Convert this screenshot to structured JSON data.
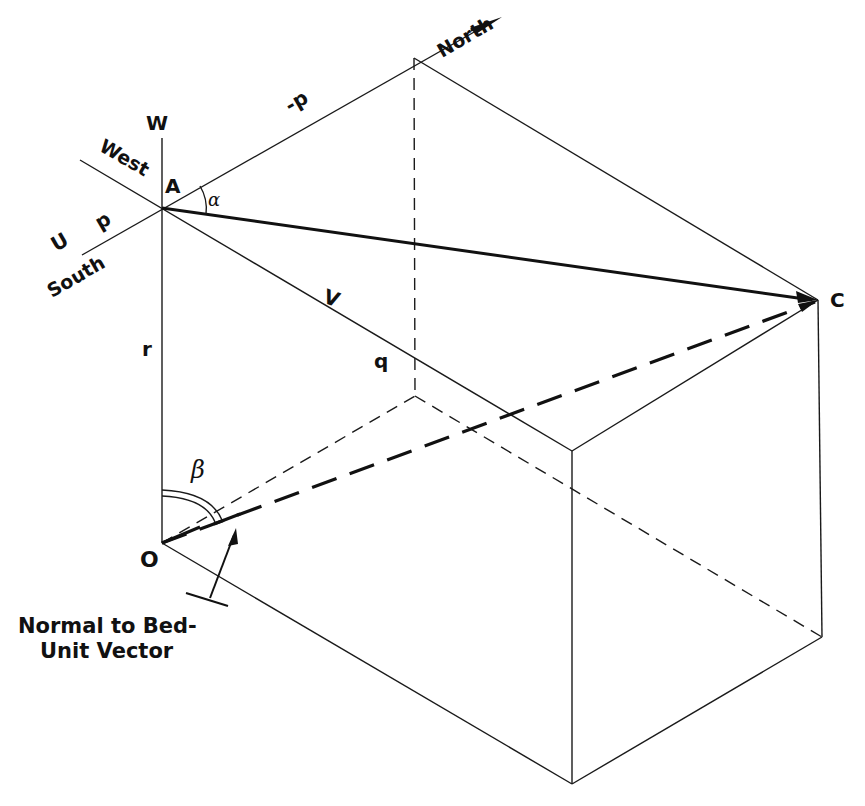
{
  "figure": {
    "points": {
      "A": "A",
      "C": "C",
      "O": "O"
    },
    "axes": {
      "W": "W",
      "U": "U",
      "V": "V",
      "p": "p",
      "neg_p": "-p",
      "q": "q",
      "r": "r"
    },
    "directions": {
      "north": "North",
      "south": "South",
      "west": "West"
    },
    "angles": {
      "alpha": "α",
      "beta": "β"
    },
    "annotation": {
      "line1": "Normal to Bed-",
      "line2": "Unit Vector"
    },
    "colors": {
      "line": "#111111",
      "background": "#ffffff"
    }
  }
}
